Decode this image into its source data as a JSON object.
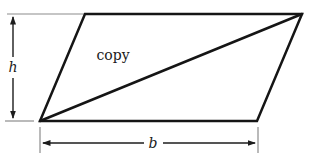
{
  "diagram": {
    "interior_label": "copy",
    "height_label": "h",
    "base_label": "b"
  },
  "colors": {
    "background": "#ffffff",
    "shape_line": "#151515",
    "dimension_line": "#1c1c1c",
    "extension_line": "#8c8c8c",
    "text": "#1a1a1a"
  }
}
